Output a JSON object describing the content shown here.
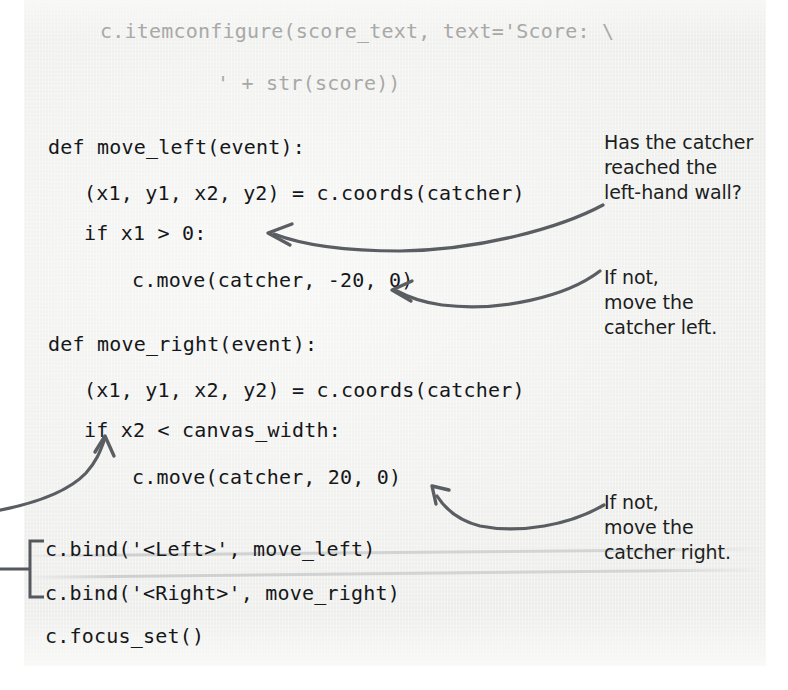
{
  "page": {
    "kind": "scanned-book-page",
    "background_color": "#f1f1ef",
    "ink_color": "#15171a",
    "faded_ink_color": "#a8a9a7",
    "annotation_ink_color": "#1c1e21",
    "arrow_color": "#5a5d61"
  },
  "code": {
    "lines": [
      {
        "text": "c.itemconfigure(score_text, text='Score: \\",
        "faded": true
      },
      {
        "text": "' + str(score))",
        "faded": true
      },
      {
        "text": "def move_left(event):",
        "faded": false
      },
      {
        "text": "(x1, y1, x2, y2) = c.coords(catcher)",
        "faded": false
      },
      {
        "text": "if x1 > 0:",
        "faded": false
      },
      {
        "text": "c.move(catcher, -20, 0)",
        "faded": false
      },
      {
        "text": "def move_right(event):",
        "faded": false
      },
      {
        "text": "(x1, y1, x2, y2) = c.coords(catcher)",
        "faded": false
      },
      {
        "text": "if x2 < canvas_width:",
        "faded": false
      },
      {
        "text": "c.move(catcher, 20, 0)",
        "faded": false
      },
      {
        "text": "c.bind('<Left>', move_left)",
        "faded": false
      },
      {
        "text": "c.bind('<Right>', move_right)",
        "faded": false
      },
      {
        "text": "c.focus_set()",
        "faded": false
      }
    ]
  },
  "annotations": [
    {
      "id": "catcher-left-wall-note",
      "text": "Has the catcher\nreached the\nleft-hand wall?"
    },
    {
      "id": "move-catcher-left-note",
      "text": "If not,\nmove the\ncatcher left."
    },
    {
      "id": "move-catcher-right-note",
      "text": "If not,\nmove the\ncatcher right."
    }
  ],
  "callout_arrows": [
    {
      "id": "arrow-to-if-x1",
      "points_to": "if x1 > 0:"
    },
    {
      "id": "arrow-to-move-left",
      "points_to": "c.move(catcher, -20, 0)"
    },
    {
      "id": "arrow-to-if-x2",
      "points_to": "if x2 < canvas_width:"
    },
    {
      "id": "arrow-to-move-right",
      "points_to": "c.move(catcher, 20, 0)"
    },
    {
      "id": "bracket-bind-lines",
      "points_to": "c.bind lines grouping bracket"
    }
  ]
}
